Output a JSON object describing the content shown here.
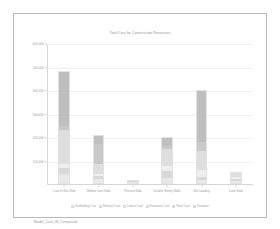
{
  "figure": {
    "caption": "Model_Cost_W_Compared"
  },
  "chart_data": {
    "type": "bar",
    "stacked": true,
    "title": "Total Cost for Construction Resources",
    "xlabel": "",
    "ylabel": "",
    "ylim": [
      0,
      600000
    ],
    "grid": true,
    "legend_position": "bottom",
    "categories": [
      "Cast In Situ Slab",
      "Hollow Core Slab",
      "Precast Slab",
      "Double Storey Walls",
      "Site Loading",
      "Lane Slab"
    ],
    "ytick_labels": [
      "600,000",
      "500,000",
      "400,000",
      "300,000",
      "200,000",
      "100,000"
    ],
    "ytick_values": [
      600000,
      500000,
      400000,
      300000,
      200000,
      100000
    ],
    "series": [
      {
        "name": "Scaffolding Cost",
        "color": "#e9e9e9",
        "values": [
          38000,
          16000,
          9000,
          21000,
          15000,
          12000
        ]
      },
      {
        "name": "Material Cost",
        "color": "#d8d8d8",
        "values": [
          26000,
          14000,
          5000,
          34000,
          12000,
          9000
        ]
      },
      {
        "name": "Labour Cost",
        "color": "#efefef",
        "values": [
          19000,
          11000,
          4000,
          22000,
          28000,
          8000
        ]
      },
      {
        "name": "Formwork Cost",
        "color": "#dedede",
        "values": [
          148000,
          42000,
          0,
          74000,
          86000,
          24000
        ]
      },
      {
        "name": "Plant Cost",
        "color": "#c9c9c9",
        "values": [
          18000,
          88000,
          0,
          14000,
          38000,
          0
        ]
      },
      {
        "name": "Transport",
        "color": "#bfbfbf",
        "values": [
          231000,
          39000,
          0,
          35000,
          221000,
          0
        ]
      }
    ],
    "totals": [
      480000,
      210000,
      18000,
      200000,
      400000,
      53000
    ]
  }
}
